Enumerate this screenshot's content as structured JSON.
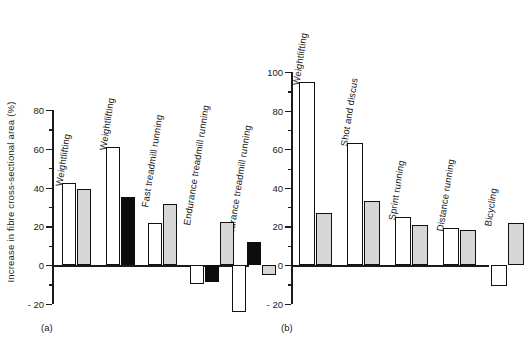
{
  "figure": {
    "ylabel": "Increase in fibre cross-sectional area (%)",
    "panel_a_label": "(a)",
    "panel_b_label": "(b)"
  },
  "chart_data": [
    {
      "type": "bar",
      "panel": "(a)",
      "title": "",
      "xlabel": "",
      "ylabel": "Increase in fibre cross-sectional area (%)",
      "ylim": [
        -20,
        80
      ],
      "yticks": [
        -20,
        0,
        20,
        40,
        60,
        80
      ],
      "yticklabels": [
        "- 20",
        "0",
        "20",
        "40",
        "60",
        "80"
      ],
      "minor_tick_step": 10,
      "grid": false,
      "legend": "none",
      "categories": [
        "Weightlifting",
        "Weightlifting",
        "Fast treadmill running",
        "Endurance treadmill running",
        "Endurance treadmill running"
      ],
      "groups": [
        {
          "label": "Weightlifting",
          "bars": [
            {
              "fill": "white",
              "value": 42.5
            },
            {
              "fill": "gray",
              "value": 39
            }
          ]
        },
        {
          "label": "Weightlifting",
          "bars": [
            {
              "fill": "white",
              "value": 61
            },
            {
              "fill": "black",
              "value": 35
            }
          ]
        },
        {
          "label": "Fast treadmill running",
          "bars": [
            {
              "fill": "white",
              "value": 21.5
            },
            {
              "fill": "gray",
              "value": 31.5
            }
          ]
        },
        {
          "label": "Endurance treadmill running",
          "bars": [
            {
              "fill": "white",
              "value": -10
            },
            {
              "fill": "black",
              "value": -9
            },
            {
              "fill": "gray",
              "value": 22
            }
          ]
        },
        {
          "label": "Endurance treadmill running",
          "bars": [
            {
              "fill": "white",
              "value": -24
            },
            {
              "fill": "black",
              "value": 12
            },
            {
              "fill": "gray",
              "value": -5
            }
          ]
        }
      ]
    },
    {
      "type": "bar",
      "panel": "(b)",
      "title": "",
      "xlabel": "",
      "ylabel": "",
      "ylim": [
        -20,
        100
      ],
      "yticks": [
        -20,
        0,
        20,
        40,
        60,
        80,
        100
      ],
      "yticklabels": [
        "- 20",
        "0",
        "20",
        "40",
        "60",
        "80",
        "100"
      ],
      "minor_tick_step": 10,
      "grid": false,
      "legend": "none",
      "categories": [
        "Weightlifting",
        "Shot and discus",
        "Sprint running",
        "Distance running",
        "Bicycling"
      ],
      "groups": [
        {
          "label": "Weightlifting",
          "bars": [
            {
              "fill": "white",
              "value": 95
            },
            {
              "fill": "gray",
              "value": 27
            }
          ]
        },
        {
          "label": "Shot and discus",
          "bars": [
            {
              "fill": "white",
              "value": 63
            },
            {
              "fill": "gray",
              "value": 33
            }
          ]
        },
        {
          "label": "Sprint running",
          "bars": [
            {
              "fill": "white",
              "value": 25
            },
            {
              "fill": "gray",
              "value": 20.5
            }
          ]
        },
        {
          "label": "Distance running",
          "bars": [
            {
              "fill": "white",
              "value": 19
            },
            {
              "fill": "gray",
              "value": 18
            }
          ]
        },
        {
          "label": "Bicycling",
          "bars": [
            {
              "fill": "white",
              "value": -11
            },
            {
              "fill": "gray",
              "value": 22
            }
          ]
        }
      ]
    }
  ]
}
